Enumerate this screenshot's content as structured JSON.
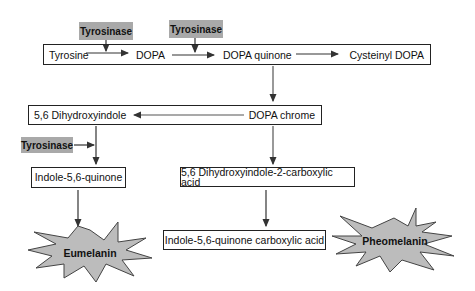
{
  "diagram": {
    "enzymes": [
      "Tyrosinase",
      "Tyrosinase",
      "Tyrosinase"
    ],
    "row1": {
      "tyrosine": "Tyrosine",
      "dopa": "DOPA",
      "dopa_quinone": "DOPA quinone",
      "cysteinyl_dopa": "Cysteinyl DOPA"
    },
    "row2": {
      "dihydroxyindole": "5,6 Dihydroxyindole",
      "dopa_chrome": "DOPA chrome"
    },
    "indole_quinone": "Indole-5,6-quinone",
    "dhica": "5,6 Dihydroxyindole-2-carboxylic acid",
    "iqca": "Indole-5,6-quinone carboxylic acid",
    "products": {
      "eumelanin": "Eumelanin",
      "pheomelanin": "Pheomelanin"
    },
    "colors": {
      "enzyme_fill": "#a9a9a9",
      "star_fill": "#bcbcbc",
      "line": "#222222"
    }
  }
}
